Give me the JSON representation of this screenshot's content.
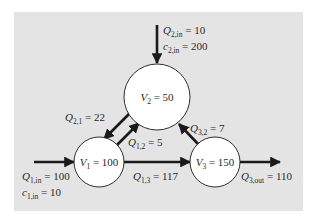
{
  "diagram": {
    "type": "three-reactor flow network",
    "colors": {
      "background_panel": "#e4e4e4",
      "circle_fill": "#ffffff",
      "stroke": "#1a1a1a",
      "text": "#2a2a2a"
    },
    "nodes": [
      {
        "id": "V2",
        "var": "V",
        "sub": "2",
        "value": "50",
        "cx": 157,
        "cy": 97,
        "r": 33
      },
      {
        "id": "V1",
        "var": "V",
        "sub": "1",
        "value": "100",
        "cx": 99,
        "cy": 162,
        "r": 25
      },
      {
        "id": "V3",
        "var": "V",
        "sub": "3",
        "value": "150",
        "cx": 215,
        "cy": 162,
        "r": 25
      }
    ],
    "flows": [
      {
        "id": "Q2in",
        "var": "Q",
        "sub": "2,in",
        "value": "10",
        "from": "external",
        "to": "V2"
      },
      {
        "id": "Q21",
        "var": "Q",
        "sub": "2,1",
        "value": "22",
        "from": "V2",
        "to": "V1"
      },
      {
        "id": "Q12",
        "var": "Q",
        "sub": "1,2",
        "value": "5",
        "from": "V1",
        "to": "V2"
      },
      {
        "id": "Q32",
        "var": "Q",
        "sub": "3,2",
        "value": "7",
        "from": "V3",
        "to": "V2"
      },
      {
        "id": "Q1in",
        "var": "Q",
        "sub": "1,in",
        "value": "100",
        "from": "external",
        "to": "V1"
      },
      {
        "id": "Q13",
        "var": "Q",
        "sub": "1,3",
        "value": "117",
        "from": "V1",
        "to": "V3"
      },
      {
        "id": "Q3out",
        "var": "Q",
        "sub": "3,out",
        "value": "110",
        "from": "V3",
        "to": "external"
      }
    ],
    "concentrations": [
      {
        "id": "c2in",
        "var": "c",
        "sub": "2,in",
        "value": "200"
      },
      {
        "id": "c1in",
        "var": "c",
        "sub": "1,in",
        "value": "10"
      }
    ],
    "labels": {
      "eq": " = ",
      "V2": {
        "var": "V",
        "sub": "2",
        "rest": " = 50"
      },
      "V1": {
        "var": "V",
        "sub": "1",
        "rest": " = 100"
      },
      "V3": {
        "var": "V",
        "sub": "3",
        "rest": " = 150"
      },
      "Q2in": {
        "var": "Q",
        "sub": "2,in",
        "rest": " = 10"
      },
      "c2in": {
        "var": "c",
        "sub": "2,in",
        "rest": " = 200"
      },
      "Q21": {
        "var": "Q",
        "sub": "2,1",
        "rest": " = 22"
      },
      "Q12": {
        "var": "Q",
        "sub": "1,2",
        "rest": " = 5"
      },
      "Q32": {
        "var": "Q",
        "sub": "3,2",
        "rest": " = 7"
      },
      "Q1in": {
        "var": "Q",
        "sub": "1,in",
        "rest": " = 100"
      },
      "c1in": {
        "var": "c",
        "sub": "1,in",
        "rest": " = 10"
      },
      "Q13": {
        "var": "Q",
        "sub": "1,3",
        "rest": " = 117"
      },
      "Q3out": {
        "var": "Q",
        "sub": "3,out",
        "rest": " = 110"
      }
    }
  }
}
